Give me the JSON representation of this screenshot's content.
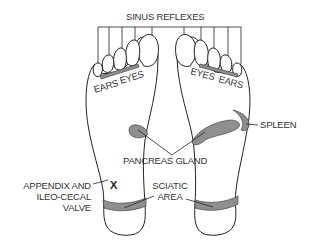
{
  "diagram": {
    "colors": {
      "outline": "#222222",
      "zone_fill": "#8f8f8f",
      "text": "#333333",
      "background": "#ffffff"
    },
    "labels": {
      "sinus_reflexes": "SINUS REFLEXES",
      "left_ears": "EARS",
      "left_eyes": "EYES",
      "right_eyes": "EYES",
      "right_ears": "EARS",
      "spleen": "SPLEEN",
      "pancreas_gland": "PANCREAS GLAND",
      "appendix_line1": "APPENDIX AND",
      "appendix_line2": "ILEO-CECAL",
      "appendix_line3": "VALVE",
      "sciatic_line1": "SCIATIC",
      "sciatic_line2": "AREA",
      "appendix_marker": "X"
    }
  }
}
